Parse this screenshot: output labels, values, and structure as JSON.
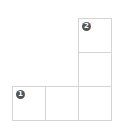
{
  "grid": {
    "cells": [
      {
        "id": "top-right",
        "badge": "2"
      },
      {
        "id": "middle-right",
        "badge": ""
      },
      {
        "id": "bottom-left",
        "badge": "1"
      },
      {
        "id": "bottom-middle",
        "badge": ""
      },
      {
        "id": "bottom-right",
        "badge": ""
      }
    ]
  }
}
